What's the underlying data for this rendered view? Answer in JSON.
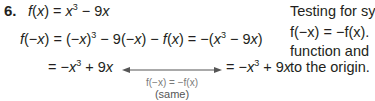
{
  "problem": {
    "number": "6.",
    "line1": {
      "lhs": "f(x)",
      "rhs_a": "x",
      "rhs_exp": "3",
      "rhs_b": " − 9x"
    },
    "line2": {
      "lhs": "f(−x)",
      "part1": "(−x)",
      "exp1": "3",
      "part2": " − 9(−x) − f(x) = −(x",
      "exp2": "3",
      "part3": " − 9x)"
    },
    "line3": {
      "left_a": "= −x",
      "left_exp": "3",
      "left_b": " + 9x",
      "right_a": "= −x",
      "right_exp": "3",
      "right_b": " + 9x"
    },
    "annotation": {
      "relation": "f(−x) = −f(x)",
      "label": "(same)"
    }
  },
  "side_text": {
    "line1": "Testing for sy",
    "line2": "f(−x) = −f(x).",
    "line3": "function and",
    "line4": "to the origin."
  }
}
